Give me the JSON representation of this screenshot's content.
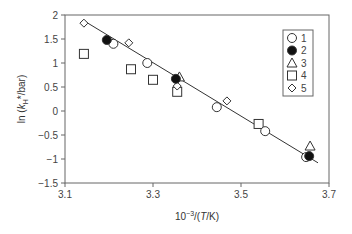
{
  "chart_data": {
    "type": "scatter",
    "title": "",
    "xlabel": "10^-3/(T/K)",
    "ylabel": "ln (kH*/bar)",
    "xlim": [
      3.1,
      3.7
    ],
    "ylim": [
      -1.5,
      2
    ],
    "xticks": [
      "3.1",
      "3.3",
      "3.5",
      "3.7"
    ],
    "yticks": [
      "2",
      "1.5",
      "1",
      "0.5",
      "0",
      "-0.5",
      "-1",
      "-1.5"
    ],
    "grid": false,
    "legend_position": "upper right",
    "series": [
      {
        "name": "1",
        "marker": "open-circle",
        "points": [
          [
            3.21,
            1.4
          ],
          [
            3.287,
            1.0
          ],
          [
            3.445,
            0.08
          ],
          [
            3.555,
            -0.42
          ],
          [
            3.648,
            -0.96
          ]
        ]
      },
      {
        "name": "2",
        "marker": "filled-circle",
        "points": [
          [
            3.195,
            1.48
          ],
          [
            3.352,
            0.67
          ],
          [
            3.655,
            -0.94
          ]
        ]
      },
      {
        "name": "3",
        "marker": "open-triangle",
        "points": [
          [
            3.36,
            0.71
          ],
          [
            3.657,
            -0.73
          ]
        ]
      },
      {
        "name": "4",
        "marker": "open-square",
        "points": [
          [
            3.143,
            1.19
          ],
          [
            3.25,
            0.87
          ],
          [
            3.3,
            0.65
          ],
          [
            3.355,
            0.4
          ],
          [
            3.54,
            -0.27
          ]
        ]
      },
      {
        "name": "5",
        "marker": "open-diamond",
        "points": [
          [
            3.143,
            1.83
          ],
          [
            3.245,
            1.42
          ],
          [
            3.355,
            0.52
          ],
          [
            3.468,
            0.21
          ]
        ]
      }
    ],
    "fit_line": {
      "x": [
        3.143,
        3.675
      ],
      "y": [
        1.88,
        -1.08
      ]
    }
  },
  "axes": {
    "x_label_prefix": "10",
    "x_label_exp": "−3",
    "x_label_suffix_open": "/(",
    "x_label_italic": "T",
    "x_label_suffix_close": "/K)",
    "y_label_prefix": "ln (",
    "y_label_italic": "k",
    "y_label_sub": "H",
    "y_label_suffix": "*/bar)",
    "x_tick_labels": [
      "3.1",
      "3.3",
      "3.5",
      "3.7"
    ],
    "y_tick_labels": [
      "2",
      "1.5",
      "1",
      "0.5",
      "0",
      "−0.5",
      "−1",
      "−1.5"
    ]
  },
  "legend": {
    "items": [
      {
        "marker": "open-circle",
        "label": "1"
      },
      {
        "marker": "filled-circle",
        "label": "2"
      },
      {
        "marker": "open-triangle",
        "label": "3"
      },
      {
        "marker": "open-square",
        "label": "4"
      },
      {
        "marker": "open-diamond",
        "label": "5"
      }
    ]
  },
  "colors": {
    "axis": "#555555",
    "marker_stroke": "#333333",
    "marker_fill_filled": "#111111",
    "line": "#333333"
  }
}
